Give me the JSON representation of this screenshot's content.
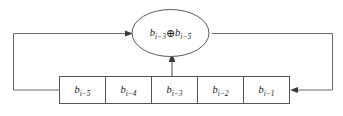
{
  "diagram": {
    "type": "block-diagram",
    "background_color": "#ffffff",
    "line_color": "#6b6b6b",
    "box_stroke_color": "#555555",
    "text_color": "#1c1c1c",
    "register": {
      "name": "shift-register",
      "cell_count": 5,
      "cells": [
        {
          "id": "cell-0",
          "base": "b",
          "subscript": "i−5",
          "label": "b i−5"
        },
        {
          "id": "cell-1",
          "base": "b",
          "subscript": "i−4",
          "label": "b i−4"
        },
        {
          "id": "cell-2",
          "base": "b",
          "subscript": "i−3",
          "label": "b i−3"
        },
        {
          "id": "cell-3",
          "base": "b",
          "subscript": "i−2",
          "label": "b i−2"
        },
        {
          "id": "cell-4",
          "base": "b",
          "subscript": "i−1",
          "label": "b i−1"
        }
      ]
    },
    "xor_node": {
      "name": "xor-node",
      "operator": "⊕",
      "left_operand_base": "b",
      "left_operand_sub": "i−3",
      "right_operand_base": "b",
      "right_operand_sub": "i−5",
      "label": "b i−3 ⊕ b i−5"
    },
    "connections": [
      {
        "name": "tap-wire-from-cell-2",
        "from": "cell-2",
        "to": "xor-node",
        "direction": "up",
        "arrow": true
      },
      {
        "name": "feedback-wire-right",
        "from": "xor-node",
        "to": "register-right-input",
        "direction": "right-down-left",
        "arrow": true
      },
      {
        "name": "feedback-wire-left",
        "from": "register-left-output",
        "to": "xor-node",
        "direction": "left-up-right",
        "arrow": true
      }
    ]
  }
}
